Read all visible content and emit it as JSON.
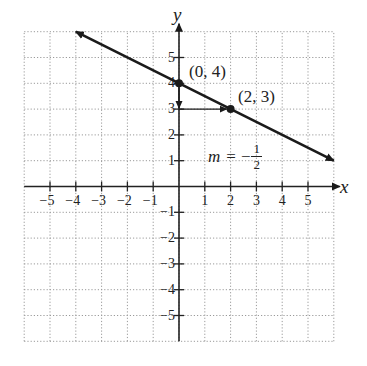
{
  "chart_data": {
    "type": "line",
    "title": "",
    "xlabel": "x",
    "ylabel": "y",
    "xlim": [
      -6,
      6
    ],
    "ylim": [
      -6,
      6
    ],
    "grid": true,
    "x_ticks": [
      "−5",
      "−4",
      "−3",
      "−2",
      "−1",
      "1",
      "2",
      "3",
      "4",
      "5"
    ],
    "x_tick_values": [
      -5,
      -4,
      -3,
      -2,
      -1,
      1,
      2,
      3,
      4,
      5
    ],
    "y_ticks": [
      "5",
      "4",
      "3",
      "2",
      "1",
      "−1",
      "−2",
      "−3",
      "−4",
      "−5"
    ],
    "y_tick_values": [
      5,
      4,
      3,
      2,
      1,
      -1,
      -2,
      -3,
      -4,
      -5
    ],
    "series": [
      {
        "name": "line",
        "equation": "y = -1/2 x + 4",
        "x": [
          -4,
          6
        ],
        "y": [
          6,
          1
        ],
        "arrows": "both"
      }
    ],
    "points": [
      {
        "x": 0,
        "y": 4,
        "label": "(0, 4)"
      },
      {
        "x": 2,
        "y": 3,
        "label": "(2, 3)"
      }
    ],
    "annotations": {
      "rise_arrow": {
        "from": [
          0,
          4
        ],
        "to": [
          0,
          3
        ],
        "label": ""
      },
      "run_arrow": {
        "from": [
          0,
          3
        ],
        "to": [
          2,
          3
        ],
        "label": ""
      },
      "slope_label": {
        "m": "m",
        "equals": "=",
        "sign": "−",
        "numerator": "1",
        "denominator": "2"
      }
    },
    "colors": {
      "line": "#1a1a1a",
      "grid": "#9a9a9a",
      "axes": "#222222"
    }
  }
}
